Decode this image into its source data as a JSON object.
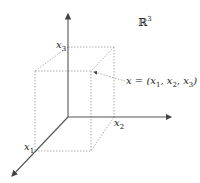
{
  "space_label": {
    "symbol": "ℝ",
    "superscript": "3"
  },
  "axes": [
    {
      "name": "x1",
      "label": "x",
      "sub": "1"
    },
    {
      "name": "x2",
      "label": "x",
      "sub": "2"
    },
    {
      "name": "x3",
      "label": "x",
      "sub": "3"
    }
  ],
  "point_annotation": {
    "lhs": "x = (",
    "x1": "x",
    "s1": "1",
    "sep1": ", ",
    "x2": "x",
    "s2": "2",
    "sep2": ", ",
    "x3": "x",
    "s3": "3",
    "close": ")"
  },
  "colors": {
    "axis": "#555555",
    "dotted": "#999999",
    "text": "#222222"
  }
}
